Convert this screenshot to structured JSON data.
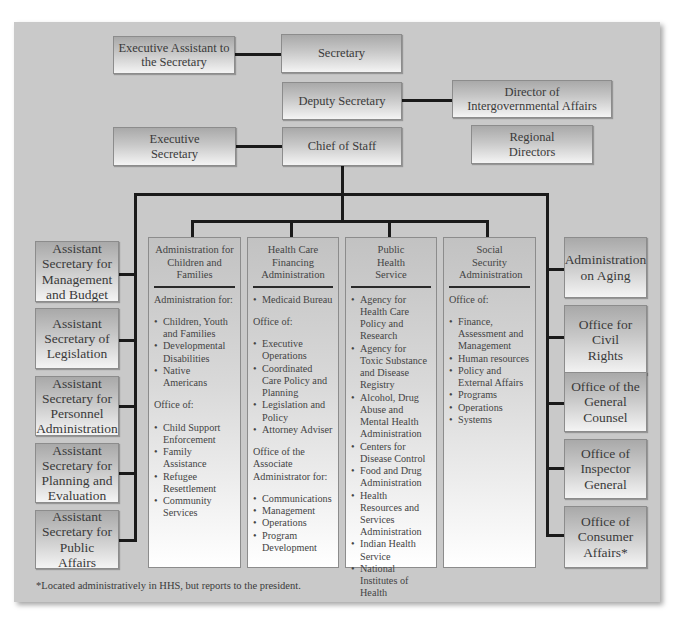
{
  "top_level": {
    "executive_assistant": "Executive Assistant to the Secretary",
    "secretary": "Secretary",
    "deputy_secretary": "Deputy Secretary",
    "director_intergovernmental": "Director of Intergovernmental Affairs",
    "executive_secretary": "Executive Secretary",
    "chief_of_staff": "Chief of Staff",
    "regional_directors": "Regional Directors"
  },
  "left_offices": [
    {
      "label": "Assistant Secretary for Management and Budget"
    },
    {
      "label": "Assistant Secretary of Legislation"
    },
    {
      "label": "Assistant Secretary for Personnel Administration"
    },
    {
      "label": "Assistant Secretary for Planning and Evaluation"
    },
    {
      "label": "Assistant Secretary for Public Affairs"
    }
  ],
  "right_offices": [
    {
      "label": "Administration on Aging"
    },
    {
      "label": "Office for Civil Rights"
    },
    {
      "label": "Office of the General Counsel"
    },
    {
      "label": "Office of Inspector General"
    },
    {
      "label": "Office of Consumer Affairs*"
    }
  ],
  "operating_divisions": [
    {
      "title": "Administration for Children and Families",
      "sections": [
        {
          "heading": "Administration for:",
          "items": [
            "Children, Youth and Families",
            "Developmental Disabilities",
            "Native Americans"
          ]
        },
        {
          "heading": "Office of:",
          "items": [
            "Child Support Enforcement",
            "Family Assistance",
            "Refugee Resettlement",
            "Community Services"
          ]
        }
      ]
    },
    {
      "title": "Health Care Financing Administration",
      "sections": [
        {
          "heading": "",
          "items": [
            "Medicaid Bureau"
          ]
        },
        {
          "heading": "Office of:",
          "items": [
            "Executive Operations",
            "Coordinated Care Policy and Planning",
            "Legislation and Policy",
            "Attorney Adviser"
          ]
        },
        {
          "heading": "Office of the Associate Administrator for:",
          "items": [
            "Communications",
            "Management",
            "Operations",
            "Program Development"
          ]
        }
      ]
    },
    {
      "title": "Public Health Service",
      "sections": [
        {
          "heading": "",
          "items": [
            "Agency for Health Care Policy and Research",
            "Agency for Toxic Substance and Disease Registry",
            "Alcohol, Drug Abuse and Mental Health Administration",
            "Centers for Disease Control",
            "Food and Drug Administration",
            "Health Resources and Services Administration",
            "Indian Health Service",
            "National Institutes of Health"
          ]
        }
      ]
    },
    {
      "title": "Social Security Administration",
      "sections": [
        {
          "heading": "Office of:",
          "items": [
            "Finance, Assessment and Management",
            "Human resources",
            "Policy and External Affairs",
            "Programs",
            "Operations",
            "Systems"
          ]
        }
      ]
    }
  ],
  "footnote": "*Located administratively in HHS, but reports to the president."
}
